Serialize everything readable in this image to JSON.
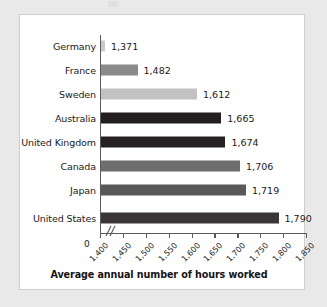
{
  "figure": {
    "background_color": "#e9e9ea",
    "panel_color": "#ffffff",
    "panel_border_color": "#cfcfcf"
  },
  "chart_data": {
    "type": "bar",
    "orientation": "horizontal",
    "title": "",
    "xlabel": "Average annual number of hours worked",
    "ylabel": "",
    "categories": [
      "Germany",
      "France",
      "Sweden",
      "Australia",
      "United Kingdom",
      "Canada",
      "Japan",
      "United States"
    ],
    "values": [
      1371,
      1482,
      1612,
      1665,
      1674,
      1706,
      1719,
      1790
    ],
    "value_labels": [
      "1,371",
      "1,482",
      "1,612",
      "1,665",
      "1,674",
      "1,706",
      "1,719",
      "1,790"
    ],
    "bar_colors": [
      "#c9c9c9",
      "#8a8a8a",
      "#c2c2c2",
      "#231f20",
      "#262223",
      "#6e6e6e",
      "#595959",
      "#3a3536"
    ],
    "xlim": [
      1400,
      1850
    ],
    "xticks": [
      1400,
      1450,
      1500,
      1550,
      1600,
      1650,
      1700,
      1750,
      1800,
      1850
    ],
    "xtick_labels": [
      "1,400",
      "1,450",
      "1,500",
      "1,550",
      "1,600",
      "1,650",
      "1,700",
      "1,750",
      "1,800",
      "1,850"
    ],
    "origin_label": "0",
    "axis_break": true,
    "grid": false,
    "legend": null
  }
}
